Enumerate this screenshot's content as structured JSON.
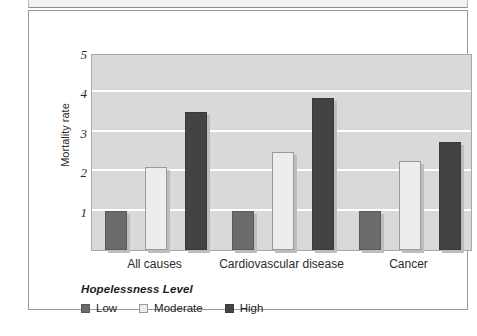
{
  "chart_data": {
    "type": "bar",
    "title": "",
    "subtitle": "",
    "xlabel": "",
    "ylabel": "Mortality rate",
    "categories": [
      "All causes",
      "Cardiovascular disease",
      "Cancer"
    ],
    "series": [
      {
        "name": "Low",
        "color": "#6b6b6b",
        "values": [
          1.0,
          1.0,
          1.0
        ]
      },
      {
        "name": "Moderate",
        "color": "#ededed",
        "values": [
          2.1,
          2.5,
          2.25
        ]
      },
      {
        "name": "High",
        "color": "#434343",
        "values": [
          3.5,
          3.85,
          2.75
        ]
      }
    ],
    "ylim": [
      0,
      5
    ],
    "yticks": [
      1,
      2,
      3,
      4,
      5
    ],
    "ytick_labels": [
      "1",
      "2",
      "3",
      "4",
      "5"
    ],
    "grid": true,
    "grid_color": "#ffffff",
    "plot_background": "#d9d9d9",
    "legend_position": "below-axes-left"
  },
  "legend": {
    "title": "Hopelessness Level",
    "items": [
      {
        "label": "Low",
        "swatch": "series-low"
      },
      {
        "label": "Moderate",
        "swatch": "series-mod"
      },
      {
        "label": "High",
        "swatch": "series-high"
      }
    ]
  },
  "axes": {
    "y_title": "Mortality rate",
    "y_tick_labels": [
      "5",
      "4",
      "3",
      "2",
      "1"
    ],
    "x_tick_labels": [
      "All causes",
      "Cardiovascular disease",
      "Cancer"
    ]
  }
}
